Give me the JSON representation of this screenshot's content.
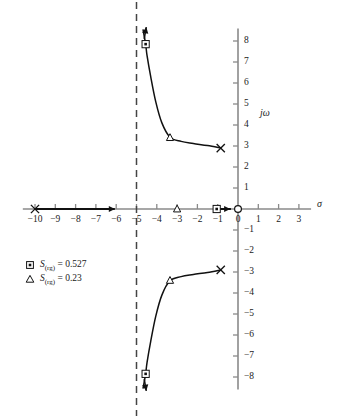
{
  "chart_data": {
    "type": "line",
    "title": "",
    "xlabel": "σ",
    "ylabel": "jω",
    "xlim": [
      -10.6,
      3.6
    ],
    "ylim": [
      -8.6,
      8.6
    ],
    "xticks": [
      -10,
      -9,
      -8,
      -7,
      -6,
      -5,
      -4,
      -3,
      -2,
      -1,
      0,
      1,
      2,
      3
    ],
    "xtick_labels": [
      "−10",
      "−9",
      "−8",
      "−7",
      "−6",
      "−5",
      "−4",
      "−3",
      "−2",
      "−1",
      "0",
      "1",
      "2",
      "3"
    ],
    "yticks": [
      8,
      7,
      6,
      5,
      4,
      3,
      2,
      1,
      -1,
      -2,
      -3,
      -4,
      -5,
      -6,
      -7,
      -8
    ],
    "ytick_labels": [
      "8",
      "7",
      "6",
      "5",
      "4",
      "3",
      "2",
      "1",
      "−1",
      "−2",
      "−3",
      "−4",
      "−5",
      "−6",
      "−7",
      "−8"
    ],
    "grid": false,
    "legend_position": "lower-left",
    "asymptote": {
      "type": "vertical-dashed",
      "sigma": -5
    },
    "poles": [
      {
        "sigma": -10,
        "omega": 0,
        "marker": "x"
      },
      {
        "sigma": -0.85,
        "omega": 2.9,
        "marker": "x"
      },
      {
        "sigma": -0.85,
        "omega": -2.9,
        "marker": "x"
      }
    ],
    "zeros": [
      {
        "sigma": 0,
        "omega": 0,
        "marker": "o"
      }
    ],
    "sensitivity_points": [
      {
        "sigma": -4.55,
        "omega": 7.85,
        "marker": "square"
      },
      {
        "sigma": -3.35,
        "omega": 3.4,
        "marker": "triangle"
      },
      {
        "sigma": -3.0,
        "omega": 0,
        "marker": "triangle"
      },
      {
        "sigma": -1.05,
        "omega": 0,
        "marker": "square"
      },
      {
        "sigma": -3.35,
        "omega": -3.4,
        "marker": "triangle"
      },
      {
        "sigma": -4.55,
        "omega": -7.85,
        "marker": "square"
      }
    ],
    "branches": [
      {
        "name": "upper-complex-branch",
        "points": [
          [
            -0.85,
            2.9
          ],
          [
            -1.5,
            3.02
          ],
          [
            -2.2,
            3.12
          ],
          [
            -2.8,
            3.22
          ],
          [
            -3.35,
            3.42
          ],
          [
            -3.75,
            4.1
          ],
          [
            -4.05,
            5.1
          ],
          [
            -4.3,
            6.3
          ],
          [
            -4.48,
            7.3
          ],
          [
            -4.55,
            7.85
          ],
          [
            -4.68,
            8.55
          ]
        ]
      },
      {
        "name": "lower-complex-branch",
        "points": [
          [
            -0.85,
            -2.9
          ],
          [
            -1.5,
            -3.02
          ],
          [
            -2.2,
            -3.12
          ],
          [
            -2.8,
            -3.22
          ],
          [
            -3.35,
            -3.42
          ],
          [
            -3.75,
            -4.1
          ],
          [
            -4.05,
            -5.1
          ],
          [
            -4.3,
            -6.3
          ],
          [
            -4.48,
            -7.3
          ],
          [
            -4.55,
            -7.85
          ],
          [
            -4.68,
            -8.55
          ]
        ]
      },
      {
        "name": "real-axis-branch",
        "points": [
          [
            -10,
            0
          ],
          [
            -6.1,
            0
          ]
        ]
      },
      {
        "name": "real-axis-branch-right",
        "points": [
          [
            -1.05,
            0
          ],
          [
            -0.35,
            0
          ]
        ]
      }
    ],
    "legend": [
      {
        "marker": "square",
        "symbol": "S",
        "subscript": "(rg)",
        "equals": "=",
        "value": "0.527",
        "text": "S(rg) = 0.527"
      },
      {
        "marker": "triangle",
        "symbol": "S",
        "subscript": "(rg)",
        "equals": "=",
        "value": "0.23",
        "text": "S(rg) = 0.23"
      }
    ],
    "colors": {
      "curve": "#111111",
      "axis": "#8a8a8a",
      "asymptote": "#444444",
      "text": "#1a1a1a"
    }
  }
}
